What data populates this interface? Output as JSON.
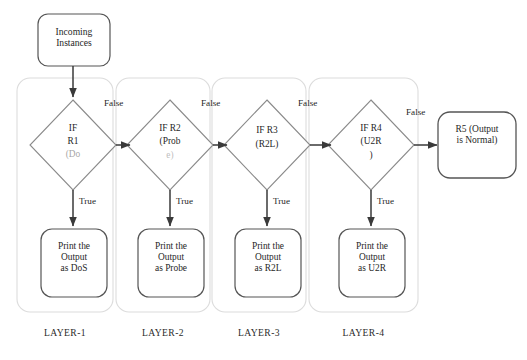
{
  "diagram": {
    "start_node": {
      "label": "Incoming\nInstances",
      "name": "incoming-instances"
    },
    "terminal_node": {
      "label": "R5 (Output\nis Normal)",
      "name": "r5-output-normal"
    },
    "decisions": [
      {
        "id": "r1",
        "label": "IF\nR1\n(DoS",
        "line1": "IF",
        "line2": "R1",
        "line3": "(Do"
      },
      {
        "id": "r2",
        "label": "IF R2\n(Prob\ne)",
        "line1": "IF R2",
        "line2": "(Prob",
        "line3": "e)"
      },
      {
        "id": "r3",
        "label": "IF R3\n(R2L)",
        "line1": "IF R3",
        "line2": "(R2L)",
        "line3": ""
      },
      {
        "id": "r4",
        "label": "IF R4\n(U2R\n)",
        "line1": "IF R4",
        "line2": "(U2R",
        "line3": ")"
      }
    ],
    "outputs": [
      {
        "id": "out-dos",
        "label": "Print the\nOutput\nas DoS"
      },
      {
        "id": "out-probe",
        "label": "Print the\nOutput\nas Probe"
      },
      {
        "id": "out-r2l",
        "label": "Print the\nOutput\nas R2L"
      },
      {
        "id": "out-u2r",
        "label": "Print the\nOutput\nas U2R"
      }
    ],
    "edge_labels": {
      "false": "False",
      "true": "True"
    },
    "false_labels": [
      "False",
      "False",
      "False",
      "False"
    ],
    "true_labels": [
      "True",
      "True",
      "True",
      "True"
    ],
    "layers": [
      {
        "id": "layer-1",
        "label": "LAYER-1"
      },
      {
        "id": "layer-2",
        "label": "LAYER-2"
      },
      {
        "id": "layer-3",
        "label": "LAYER-3"
      },
      {
        "id": "layer-4",
        "label": "LAYER-4"
      }
    ],
    "colors": {
      "stroke": "#555555",
      "container_stroke": "#d8d8d8",
      "text": "#1f1f1f",
      "background": "#ffffff"
    }
  }
}
